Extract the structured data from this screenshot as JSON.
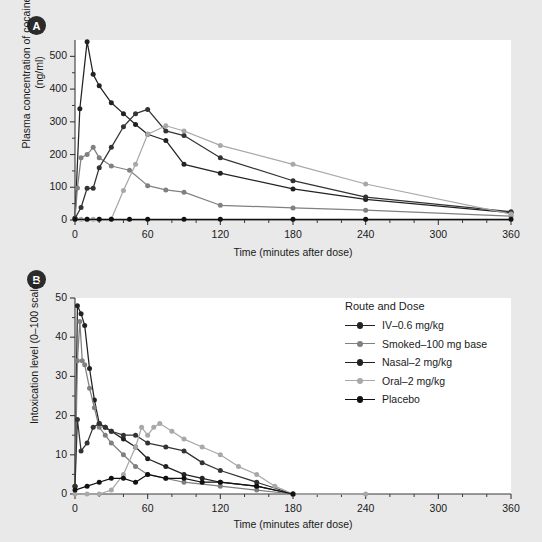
{
  "figure": {
    "background": "#e9e9e9",
    "plot_background": "#ffffff"
  },
  "panelA": {
    "tag": "A",
    "ylabel": "Plasma concentration of cocaine\n(ng/ml)",
    "ylabel_line1": "Plasma concentration of cocaine",
    "ylabel_line2": "(ng/ml)",
    "xlabel": "Time (minutes after dose)",
    "yticks": [
      "0",
      "100",
      "200",
      "300",
      "400",
      "500"
    ],
    "xticks": [
      "0",
      "60",
      "120",
      "180",
      "240",
      "300",
      "360"
    ]
  },
  "panelB": {
    "tag": "B",
    "ylabel": "Intoxication level (0–100 scale)",
    "xlabel": "Time (minutes after dose)",
    "yticks": [
      "0",
      "10",
      "20",
      "30",
      "40",
      "50"
    ],
    "xticks": [
      "0",
      "60",
      "120",
      "180",
      "240",
      "300",
      "360"
    ]
  },
  "legend": {
    "title": "Route and Dose",
    "items": [
      {
        "label": "IV–0.6 mg/kg",
        "color": "#222222"
      },
      {
        "label": "Smoked–100 mg base",
        "color": "#808080"
      },
      {
        "label": "Nasal–2 mg/kg",
        "color": "#222222"
      },
      {
        "label": "Oral–2 mg/kg",
        "color": "#a8a8a8"
      },
      {
        "label": "Placebo",
        "color": "#111111"
      }
    ]
  },
  "chart_data": [
    {
      "type": "line",
      "panel": "A",
      "title": "Plasma concentration of cocaine by route and dose",
      "xlabel": "Time (minutes after dose)",
      "ylabel": "Plasma concentration of cocaine (ng/ml)",
      "xlim": [
        0,
        360
      ],
      "ylim": [
        0,
        550
      ],
      "xticks": [
        0,
        60,
        120,
        180,
        240,
        300,
        360
      ],
      "yticks": [
        0,
        100,
        200,
        300,
        400,
        500
      ],
      "grid": false,
      "legend_position": "panel-B-right",
      "series": [
        {
          "name": "IV–0.6 mg/kg",
          "color": "#222222",
          "points": [
            [
              0,
              5
            ],
            [
              4,
              340
            ],
            [
              10,
              545
            ],
            [
              15,
              445
            ],
            [
              20,
              410
            ],
            [
              30,
              358
            ],
            [
              40,
              325
            ],
            [
              50,
              292
            ],
            [
              60,
              262
            ],
            [
              75,
              243
            ],
            [
              90,
              170
            ],
            [
              120,
              143
            ],
            [
              180,
              95
            ],
            [
              240,
              63
            ],
            [
              360,
              22
            ]
          ]
        },
        {
          "name": "Smoked–100 mg base",
          "color": "#808080",
          "points": [
            [
              0,
              3
            ],
            [
              2,
              98
            ],
            [
              5,
              190
            ],
            [
              10,
              200
            ],
            [
              15,
              222
            ],
            [
              20,
              190
            ],
            [
              30,
              165
            ],
            [
              45,
              152
            ],
            [
              60,
              105
            ],
            [
              75,
              92
            ],
            [
              90,
              85
            ],
            [
              120,
              45
            ],
            [
              180,
              37
            ],
            [
              240,
              30
            ],
            [
              360,
              12
            ]
          ]
        },
        {
          "name": "Nasal–2 mg/kg",
          "color": "#333333",
          "points": [
            [
              0,
              5
            ],
            [
              5,
              38
            ],
            [
              10,
              97
            ],
            [
              15,
              97
            ],
            [
              20,
              160
            ],
            [
              30,
              222
            ],
            [
              40,
              285
            ],
            [
              50,
              325
            ],
            [
              60,
              338
            ],
            [
              75,
              272
            ],
            [
              90,
              258
            ],
            [
              120,
              190
            ],
            [
              180,
              120
            ],
            [
              240,
              70
            ],
            [
              360,
              25
            ]
          ]
        },
        {
          "name": "Oral–2 mg/kg",
          "color": "#a8a8a8",
          "points": [
            [
              0,
              2
            ],
            [
              5,
              2
            ],
            [
              10,
              2
            ],
            [
              15,
              2
            ],
            [
              20,
              2
            ],
            [
              30,
              3
            ],
            [
              40,
              90
            ],
            [
              50,
              170
            ],
            [
              60,
              262
            ],
            [
              75,
              288
            ],
            [
              90,
              272
            ],
            [
              120,
              228
            ],
            [
              180,
              170
            ],
            [
              240,
              110
            ],
            [
              360,
              18
            ]
          ]
        },
        {
          "name": "Placebo",
          "color": "#111111",
          "points": [
            [
              0,
              2
            ],
            [
              10,
              2
            ],
            [
              20,
              2
            ],
            [
              30,
              2
            ],
            [
              45,
              2
            ],
            [
              60,
              2
            ],
            [
              90,
              2
            ],
            [
              120,
              2
            ],
            [
              180,
              2
            ],
            [
              240,
              2
            ],
            [
              360,
              2
            ]
          ]
        }
      ]
    },
    {
      "type": "line",
      "panel": "B",
      "title": "Intoxication level by route and dose",
      "xlabel": "Time (minutes after dose)",
      "ylabel": "Intoxication level (0–100 scale)",
      "xlim": [
        0,
        360
      ],
      "ylim": [
        0,
        50
      ],
      "xticks": [
        0,
        60,
        120,
        180,
        240,
        300,
        360
      ],
      "yticks": [
        0,
        10,
        20,
        30,
        40,
        50
      ],
      "grid": false,
      "legend_position": "right",
      "series": [
        {
          "name": "IV–0.6 mg/kg",
          "color": "#222222",
          "points": [
            [
              0,
              2
            ],
            [
              2,
              48
            ],
            [
              5,
              46
            ],
            [
              8,
              43
            ],
            [
              12,
              32
            ],
            [
              16,
              24
            ],
            [
              20,
              18
            ],
            [
              25,
              17
            ],
            [
              30,
              16
            ],
            [
              40,
              14
            ],
            [
              50,
              12
            ],
            [
              60,
              9
            ],
            [
              75,
              7
            ],
            [
              90,
              5
            ],
            [
              105,
              4
            ],
            [
              120,
              3
            ],
            [
              150,
              2
            ],
            [
              180,
              0
            ]
          ]
        },
        {
          "name": "Smoked–100 mg base",
          "color": "#808080",
          "points": [
            [
              0,
              2
            ],
            [
              2,
              34
            ],
            [
              4,
              44
            ],
            [
              6,
              34
            ],
            [
              8,
              33
            ],
            [
              12,
              27
            ],
            [
              16,
              22
            ],
            [
              20,
              17
            ],
            [
              25,
              15
            ],
            [
              30,
              13
            ],
            [
              40,
              10
            ],
            [
              50,
              7
            ],
            [
              60,
              5
            ],
            [
              75,
              4
            ],
            [
              90,
              3
            ],
            [
              120,
              2
            ],
            [
              150,
              1
            ],
            [
              180,
              0
            ]
          ]
        },
        {
          "name": "Nasal–2 mg/kg",
          "color": "#333333",
          "points": [
            [
              0,
              2
            ],
            [
              2,
              19
            ],
            [
              5,
              11
            ],
            [
              10,
              13
            ],
            [
              15,
              17
            ],
            [
              20,
              18
            ],
            [
              25,
              17
            ],
            [
              30,
              16
            ],
            [
              40,
              15
            ],
            [
              50,
              15
            ],
            [
              60,
              13
            ],
            [
              75,
              12
            ],
            [
              90,
              11
            ],
            [
              105,
              8
            ],
            [
              120,
              6
            ],
            [
              150,
              3
            ],
            [
              180,
              0
            ]
          ]
        },
        {
          "name": "Oral–2 mg/kg",
          "color": "#a8a8a8",
          "points": [
            [
              0,
              0
            ],
            [
              10,
              0
            ],
            [
              20,
              0
            ],
            [
              30,
              1
            ],
            [
              40,
              5
            ],
            [
              50,
              12
            ],
            [
              55,
              17
            ],
            [
              60,
              15
            ],
            [
              65,
              17
            ],
            [
              70,
              18
            ],
            [
              80,
              16
            ],
            [
              90,
              14
            ],
            [
              105,
              12
            ],
            [
              120,
              10
            ],
            [
              135,
              7
            ],
            [
              150,
              5
            ],
            [
              165,
              2
            ],
            [
              180,
              0
            ],
            [
              240,
              0
            ]
          ]
        },
        {
          "name": "Placebo",
          "color": "#111111",
          "points": [
            [
              0,
              1
            ],
            [
              10,
              2
            ],
            [
              20,
              3
            ],
            [
              30,
              4
            ],
            [
              40,
              4
            ],
            [
              50,
              3
            ],
            [
              60,
              5
            ],
            [
              75,
              4
            ],
            [
              90,
              4
            ],
            [
              105,
              3
            ],
            [
              120,
              3
            ],
            [
              150,
              2
            ],
            [
              180,
              0
            ]
          ]
        }
      ]
    }
  ]
}
